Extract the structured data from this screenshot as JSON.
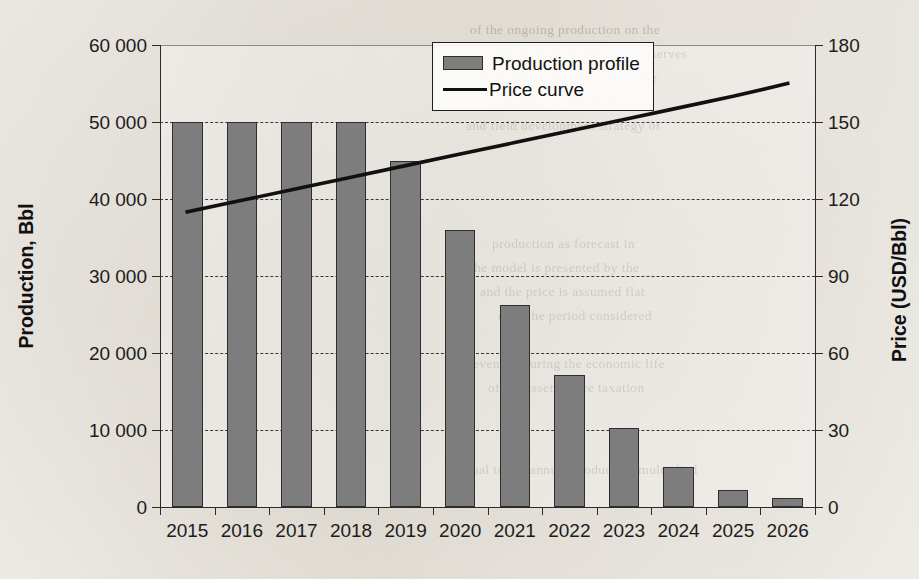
{
  "chart_data": {
    "type": "bar",
    "title": "",
    "xlabel": "",
    "ylabel": "Production, Bbl",
    "y2label": "Price (USD/Bbl)",
    "categories": [
      "2015",
      "2016",
      "2017",
      "2018",
      "2019",
      "2020",
      "2021",
      "2022",
      "2023",
      "2024",
      "2025",
      "2026"
    ],
    "ylim": [
      0,
      60000
    ],
    "y2lim": [
      0,
      180
    ],
    "yticks": [
      0,
      10000,
      20000,
      30000,
      40000,
      50000,
      60000
    ],
    "ytick_labels": [
      "0",
      "10 000",
      "20 000",
      "30 000",
      "40 000",
      "50 000",
      "60 000"
    ],
    "y2ticks": [
      0,
      30,
      60,
      90,
      120,
      150,
      180
    ],
    "y2tick_labels": [
      "0",
      "30",
      "60",
      "90",
      "120",
      "150",
      "180"
    ],
    "grid": true,
    "legend_position": "top-center",
    "series": [
      {
        "name": "Production profile",
        "type": "bar",
        "axis": "left",
        "color": "#7d7d7d",
        "values": [
          50000,
          50000,
          50000,
          50000,
          45000,
          36000,
          26300,
          17200,
          10200,
          5200,
          2200,
          1200
        ]
      },
      {
        "name": "Price curve",
        "type": "line",
        "axis": "right",
        "color": "#111111",
        "values": [
          115,
          119.5,
          124,
          128.5,
          133,
          137.5,
          142,
          146.5,
          151,
          155.5,
          160,
          165
        ]
      }
    ]
  },
  "legend": {
    "items": [
      {
        "label": "Production profile",
        "marker": "filled-square-swatch"
      },
      {
        "label": "Price curve",
        "marker": "solid-line"
      }
    ]
  },
  "ghost_text": {
    "lines": [
      {
        "text": "of the ongoing production on the",
        "x": 470,
        "y": 22
      },
      {
        "text": "analysis of the decline and reserves",
        "x": 482,
        "y": 46
      },
      {
        "text": "presented in the table above the",
        "x": 474,
        "y": 70
      },
      {
        "text": "economics of the asset are",
        "x": 486,
        "y": 94
      },
      {
        "text": "and field development strategy of",
        "x": 466,
        "y": 118
      },
      {
        "text": "production as forecast in",
        "x": 492,
        "y": 236
      },
      {
        "text": "the model is presented by the",
        "x": 470,
        "y": 260
      },
      {
        "text": "and the price is assumed flat",
        "x": 480,
        "y": 284
      },
      {
        "text": "over the period considered",
        "x": 498,
        "y": 308
      },
      {
        "text": "revenues during the economic life",
        "x": 468,
        "y": 356
      },
      {
        "text": "of the asset before taxation",
        "x": 488,
        "y": 380
      },
      {
        "text": "Equal to the annual production multiplied",
        "x": 456,
        "y": 462
      }
    ]
  }
}
